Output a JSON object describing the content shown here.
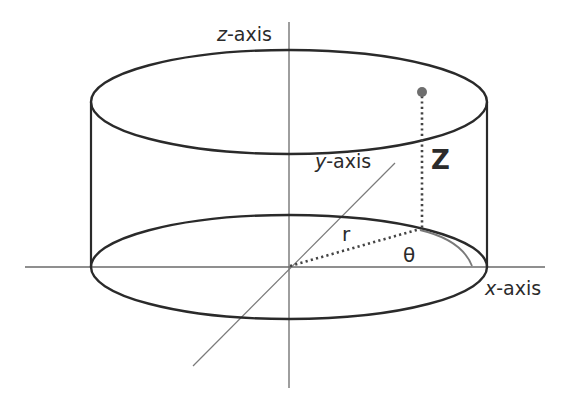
{
  "diagram": {
    "labels": {
      "z_axis": {
        "var": "z",
        "suffix": "-axis"
      },
      "y_axis": {
        "var": "y",
        "suffix": "-axis"
      },
      "x_axis": {
        "var": "x",
        "suffix": "-axis"
      },
      "z": "Z",
      "r": "r",
      "theta": "θ"
    },
    "colors": {
      "cylinder": "#2a2a2a",
      "axes": "#555555",
      "point": "#6e6e6e",
      "dotted": "#444444",
      "arc": "#777777",
      "text": "#2b2b2b"
    },
    "elements": [
      "cylinder",
      "z-axis",
      "x-axis",
      "y-axis",
      "point",
      "radius r",
      "height Z",
      "angle θ"
    ]
  }
}
